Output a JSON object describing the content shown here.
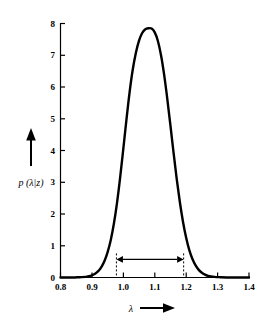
{
  "chart_data": {
    "type": "line",
    "title": "",
    "subtitle": "",
    "xlabel": "λ",
    "ylabel": "p (λ|z)",
    "xlabel_arrow": "⟶",
    "ylabel_arrow": "↑",
    "xlim": [
      0.8,
      1.4
    ],
    "ylim": [
      0.0,
      8.0
    ],
    "grid": false,
    "legend": null,
    "legend_position": "none",
    "x_ticks": [
      0.8,
      0.9,
      1.0,
      1.1,
      1.2,
      1.3,
      1.4
    ],
    "x_tick_labels": [
      "0.8",
      "0.9",
      "1.0",
      "1.1",
      "1.2",
      "1.3",
      "1.4"
    ],
    "y_ticks": [
      0,
      1,
      2,
      3,
      4,
      5,
      6,
      7,
      8
    ],
    "y_tick_labels": [
      "0",
      "1",
      "2",
      "3",
      "4",
      "5",
      "6",
      "7",
      "8"
    ],
    "series": [
      {
        "name": "p(λ|z)",
        "color": "#000000",
        "x": [
          0.8,
          0.82,
          0.84,
          0.86,
          0.88,
          0.89,
          0.9,
          0.91,
          0.92,
          0.93,
          0.94,
          0.95,
          0.96,
          0.97,
          0.98,
          0.99,
          1.0,
          1.01,
          1.02,
          1.03,
          1.04,
          1.05,
          1.06,
          1.07,
          1.08,
          1.09,
          1.1,
          1.11,
          1.12,
          1.13,
          1.14,
          1.15,
          1.16,
          1.17,
          1.18,
          1.19,
          1.2,
          1.21,
          1.22,
          1.23,
          1.24,
          1.25,
          1.26,
          1.27,
          1.29,
          1.31,
          1.34,
          1.37,
          1.4
        ],
        "y": [
          0.0,
          0.0,
          0.0,
          0.01,
          0.02,
          0.04,
          0.07,
          0.12,
          0.2,
          0.33,
          0.52,
          0.8,
          1.18,
          1.7,
          2.36,
          3.16,
          4.06,
          4.98,
          5.84,
          6.55,
          7.08,
          7.46,
          7.7,
          7.82,
          7.85,
          7.84,
          7.72,
          7.45,
          7.0,
          6.38,
          5.62,
          4.78,
          3.92,
          3.1,
          2.37,
          1.75,
          1.25,
          0.86,
          0.58,
          0.38,
          0.24,
          0.15,
          0.09,
          0.05,
          0.02,
          0.01,
          0.0,
          0.0,
          0.0
        ]
      }
    ],
    "annotations": [
      {
        "name": "credible-interval",
        "type": "double-arrow",
        "x_start": 0.978,
        "x_end": 1.192,
        "y": 0.57,
        "label": "",
        "cap_ticks": true
      }
    ]
  }
}
